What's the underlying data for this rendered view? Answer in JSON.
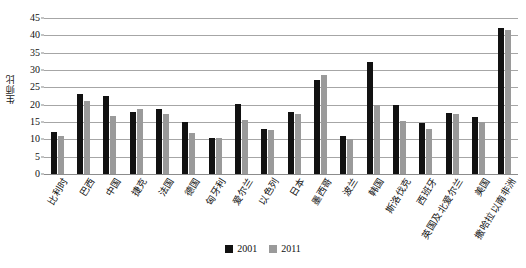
{
  "chart_data": {
    "type": "bar",
    "title": "",
    "xlabel": "",
    "ylabel": "生师比",
    "ylim": [
      0,
      45
    ],
    "ytick_step": 5,
    "yticks": [
      0,
      5,
      10,
      15,
      20,
      25,
      30,
      35,
      40,
      45
    ],
    "grid": true,
    "legend_position": "bottom",
    "categories": [
      "比利时",
      "巴西",
      "中国",
      "捷克",
      "法国",
      "德国",
      "匈牙利",
      "爱尔兰",
      "以色列",
      "日本",
      "墨西哥",
      "波兰",
      "韩国",
      "斯洛伐克",
      "西班牙",
      "英国及北爱尔兰",
      "美国",
      "撒哈拉以南非洲"
    ],
    "series": [
      {
        "name": "2001",
        "color": "#111111",
        "values": [
          12.2,
          23.0,
          22.5,
          17.8,
          18.7,
          14.9,
          10.5,
          20.2,
          13.0,
          17.9,
          27.0,
          11.0,
          32.2,
          19.8,
          14.8,
          17.7,
          16.4,
          42.0
        ]
      },
      {
        "name": "2011",
        "color": "#9a9a9a",
        "values": [
          11.1,
          21.2,
          16.8,
          18.7,
          17.4,
          11.7,
          10.4,
          15.6,
          12.6,
          17.4,
          28.5,
          10.2,
          19.8,
          15.3,
          13.0,
          17.2,
          14.9,
          41.5
        ]
      }
    ]
  },
  "legend": {
    "items": [
      {
        "label": "2001"
      },
      {
        "label": "2011"
      }
    ]
  }
}
